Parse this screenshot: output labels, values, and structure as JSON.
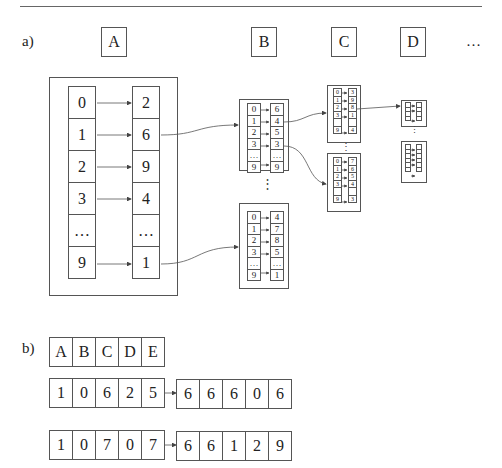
{
  "part_a": {
    "label": "a)",
    "headers": [
      "A",
      "B",
      "C",
      "D"
    ],
    "ellipsis": "…",
    "table_A": {
      "keys": [
        "0",
        "1",
        "2",
        "3",
        "…",
        "9"
      ],
      "values": [
        "2",
        "6",
        "9",
        "4",
        "…",
        "1"
      ]
    },
    "table_B1": {
      "keys": [
        "0",
        "1",
        "2",
        "3",
        "…",
        "9"
      ],
      "values": [
        "6",
        "4",
        "5",
        "3",
        "…",
        "9"
      ]
    },
    "table_B2": {
      "keys": [
        "0",
        "1",
        "2",
        "3",
        "…",
        "9"
      ],
      "values": [
        "4",
        "7",
        "8",
        "5",
        "…",
        "1"
      ]
    },
    "table_C1": {
      "keys": [
        "0",
        "1",
        "2",
        "3",
        "",
        "9"
      ],
      "values": [
        "3",
        "9",
        "8",
        "1",
        "",
        "4"
      ]
    },
    "table_C2": {
      "keys": [
        "0",
        "1",
        "2",
        "3",
        "",
        "9"
      ],
      "values": [
        "7",
        "6",
        "5",
        "4",
        "",
        "3"
      ]
    },
    "vertical_dots": "⋮"
  },
  "part_b": {
    "label": "b)",
    "header_row": [
      "A",
      "B",
      "C",
      "D",
      "E"
    ],
    "examples": [
      {
        "input": [
          "1",
          "0",
          "6",
          "2",
          "5"
        ],
        "output": [
          "6",
          "6",
          "6",
          "0",
          "6"
        ]
      },
      {
        "input": [
          "1",
          "0",
          "7",
          "0",
          "7"
        ],
        "output": [
          "6",
          "6",
          "1",
          "2",
          "9"
        ]
      }
    ]
  }
}
